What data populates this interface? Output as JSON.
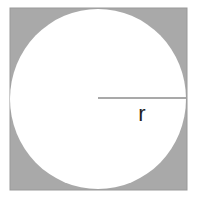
{
  "diagram": {
    "title": "",
    "square": {
      "x": 10,
      "y": 8,
      "width": 177,
      "height": 182,
      "fill": "#a9a9a9",
      "stroke": "#999999"
    },
    "circle": {
      "cx": 98,
      "cy": 99,
      "rx": 88,
      "ry": 90,
      "fill": "#ffffff"
    },
    "radius_line": {
      "x1": 98,
      "y1": 98,
      "x2": 186,
      "y2": 98,
      "stroke": "#8c8c8c"
    },
    "radius_label": {
      "text": "r",
      "x": 142,
      "y": 121
    }
  }
}
